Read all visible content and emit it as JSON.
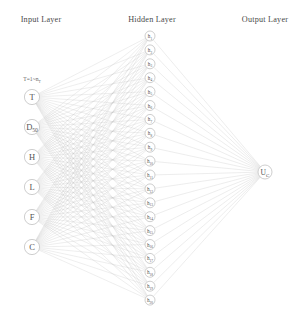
{
  "titles": {
    "input": "Input Layer",
    "hidden": "Hidden Layer",
    "output": "Output Layer"
  },
  "annotations": {
    "input_range": "T=1~n",
    "input_range_sub": "T"
  },
  "input_layer": {
    "nodes": [
      {
        "label": "T",
        "sub": ""
      },
      {
        "label": "D",
        "sub": "50"
      },
      {
        "label": "H",
        "sub": ""
      },
      {
        "label": "L",
        "sub": ""
      },
      {
        "label": "F",
        "sub": ""
      },
      {
        "label": "C",
        "sub": ""
      }
    ]
  },
  "hidden_layer": {
    "nodes": [
      {
        "label": "h",
        "sub": "1"
      },
      {
        "label": "h",
        "sub": "2"
      },
      {
        "label": "h",
        "sub": "3"
      },
      {
        "label": "h",
        "sub": "4"
      },
      {
        "label": "h",
        "sub": "5"
      },
      {
        "label": "h",
        "sub": "6"
      },
      {
        "label": "h",
        "sub": "7"
      },
      {
        "label": "h",
        "sub": "8"
      },
      {
        "label": "h",
        "sub": "9"
      },
      {
        "label": "h",
        "sub": "10"
      },
      {
        "label": "h",
        "sub": "11"
      },
      {
        "label": "h",
        "sub": "12"
      },
      {
        "label": "h",
        "sub": "13"
      },
      {
        "label": "h",
        "sub": "14"
      },
      {
        "label": "h",
        "sub": "15"
      },
      {
        "label": "h",
        "sub": "16"
      },
      {
        "label": "h",
        "sub": "17"
      },
      {
        "label": "h",
        "sub": "18"
      },
      {
        "label": "h",
        "sub": "19"
      },
      {
        "label": "h",
        "sub": "20"
      }
    ]
  },
  "output_layer": {
    "nodes": [
      {
        "label": "U",
        "sub": "C"
      }
    ]
  },
  "colors": {
    "edge": "#c3c3c3",
    "node_stroke": "#b9b9b9",
    "node_fill": "#ffffff",
    "text": "#555555",
    "title_text": "#4a4a4a",
    "background": "#ffffff"
  },
  "geometry": {
    "width": 306,
    "height": 317,
    "input_x": 32,
    "input_y_start": 97,
    "input_y_step": 30,
    "input_radius": 7.6,
    "hidden_x": 150,
    "hidden_y_start": 36,
    "hidden_y_step": 13.9,
    "hidden_radius": 5.0,
    "output_x": 265,
    "output_y": 172,
    "output_radius": 7.0,
    "title_y": 22
  }
}
